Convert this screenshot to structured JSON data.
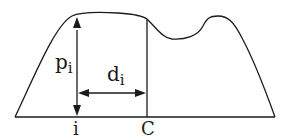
{
  "diagram": {
    "labels": {
      "p": "p",
      "p_sub": "i",
      "d": "d",
      "d_sub": "i",
      "i_tick": "i",
      "c_tick": "C"
    },
    "colors": {
      "stroke": "#1a1a1a",
      "background": "#ffffff"
    }
  }
}
